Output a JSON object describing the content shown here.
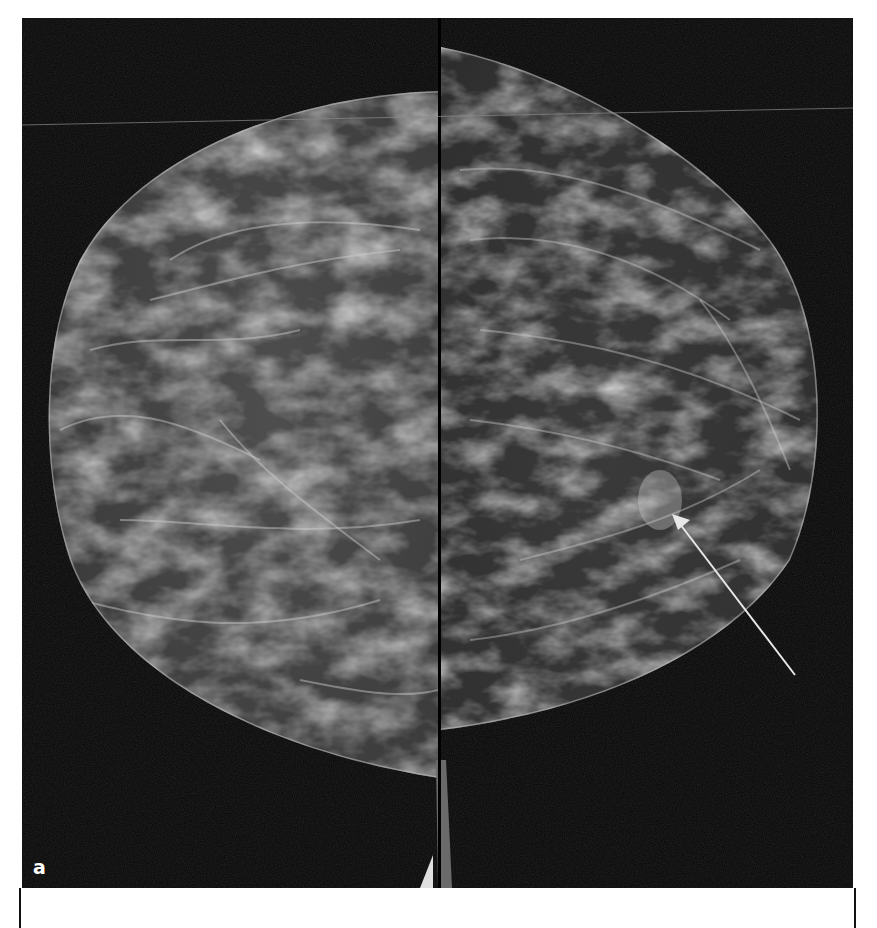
{
  "figure": {
    "panel_label": "a",
    "background_color": "#050505",
    "arrow_color": "#e8e8e8",
    "annotations": [
      {
        "type": "arrow",
        "tail": [
          795,
          675
        ],
        "head": [
          672,
          514
        ],
        "label": ""
      }
    ]
  }
}
